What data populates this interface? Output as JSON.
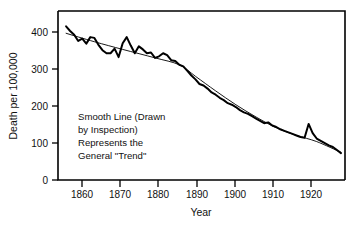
{
  "chart_data": {
    "type": "line",
    "title": "",
    "xlabel": "Year",
    "ylabel": "Death per 100,000",
    "xlim": [
      1856,
      1927
    ],
    "ylim": [
      0,
      440
    ],
    "grid": false,
    "legend_position": "none",
    "xticks": [
      1860,
      1870,
      1880,
      1890,
      1900,
      1910,
      1920
    ],
    "xtick_labels": [
      "1860",
      "1870",
      "1880",
      "1890",
      "1900",
      "1910",
      "1920"
    ],
    "yticks": [
      0,
      100,
      200,
      300,
      400
    ],
    "ytick_labels": [
      "0",
      "100",
      "200",
      "300",
      "400"
    ],
    "annotations": [
      {
        "name": "smooth-line-note",
        "lines": [
          "Smooth Line (Drawn",
          "by Inspection)",
          "Represents  the",
          "General \"Trend\""
        ],
        "x": 1864,
        "y": 195
      }
    ],
    "series": [
      {
        "name": "Observed death rate",
        "style": "jagged-observed",
        "x": [
          1858,
          1859,
          1860,
          1861,
          1862,
          1863,
          1864,
          1865,
          1866,
          1867,
          1868,
          1869,
          1870,
          1871,
          1872,
          1873,
          1874,
          1875,
          1876,
          1877,
          1878,
          1879,
          1880,
          1881,
          1882,
          1883,
          1884,
          1885,
          1886,
          1887,
          1888,
          1889,
          1890,
          1891,
          1892,
          1893,
          1894,
          1895,
          1896,
          1897,
          1898,
          1899,
          1900,
          1901,
          1902,
          1903,
          1904,
          1905,
          1906,
          1907,
          1908,
          1909,
          1910,
          1911,
          1912,
          1913,
          1914,
          1915,
          1916,
          1917,
          1918,
          1919,
          1920,
          1921,
          1922,
          1923,
          1924,
          1925,
          1926
        ],
        "values": [
          400,
          388,
          378,
          362,
          368,
          355,
          372,
          370,
          352,
          338,
          330,
          330,
          342,
          320,
          356,
          372,
          350,
          330,
          348,
          340,
          330,
          332,
          318,
          322,
          330,
          325,
          312,
          310,
          300,
          296,
          284,
          272,
          262,
          250,
          246,
          238,
          228,
          222,
          214,
          208,
          200,
          196,
          190,
          182,
          176,
          172,
          166,
          160,
          154,
          148,
          150,
          142,
          138,
          132,
          128,
          124,
          120,
          116,
          112,
          110,
          146,
          122,
          108,
          102,
          96,
          90,
          86,
          78,
          70
        ]
      },
      {
        "name": "Smooth trend line (drawn by inspection)",
        "style": "smooth-trend",
        "x": [
          1858,
          1865,
          1872,
          1880,
          1886,
          1890,
          1895,
          1900,
          1905,
          1910,
          1915,
          1920,
          1926
        ],
        "values": [
          382,
          360,
          340,
          318,
          300,
          270,
          232,
          196,
          164,
          136,
          116,
          100,
          72
        ]
      }
    ]
  }
}
